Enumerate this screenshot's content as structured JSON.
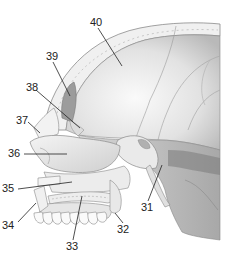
{
  "figure": {
    "colors": {
      "bone_light": "#f2f2f2",
      "bone_mid": "#d4d4d4",
      "bone_dark": "#9a9a9a",
      "outline": "#8a8a8a",
      "leader_line": "#222222",
      "label_text": "#222222",
      "background": "#ffffff"
    },
    "labels": [
      {
        "id": "40",
        "text": "40",
        "x": 90,
        "y": 18,
        "target": [
          122,
          66
        ]
      },
      {
        "id": "39",
        "text": "39",
        "x": 46,
        "y": 52,
        "target": [
          70,
          96
        ]
      },
      {
        "id": "38",
        "text": "38",
        "x": 26,
        "y": 83,
        "target": [
          80,
          128
        ]
      },
      {
        "id": "37",
        "text": "37",
        "x": 16,
        "y": 116,
        "target": [
          40,
          133
        ]
      },
      {
        "id": "36",
        "text": "36",
        "x": 8,
        "y": 149,
        "target": [
          67,
          155
        ]
      },
      {
        "id": "35",
        "text": "35",
        "x": 2,
        "y": 184,
        "target": [
          72,
          182
        ]
      },
      {
        "id": "34",
        "text": "34",
        "x": 2,
        "y": 220,
        "target": [
          36,
          203
        ]
      },
      {
        "id": "33",
        "text": "33",
        "x": 66,
        "y": 242,
        "target": [
          82,
          196
        ]
      },
      {
        "id": "32",
        "text": "32",
        "x": 117,
        "y": 225,
        "target": [
          115,
          213
        ]
      },
      {
        "id": "31",
        "text": "31",
        "x": 141,
        "y": 203,
        "target": [
          162,
          165
        ]
      }
    ]
  }
}
